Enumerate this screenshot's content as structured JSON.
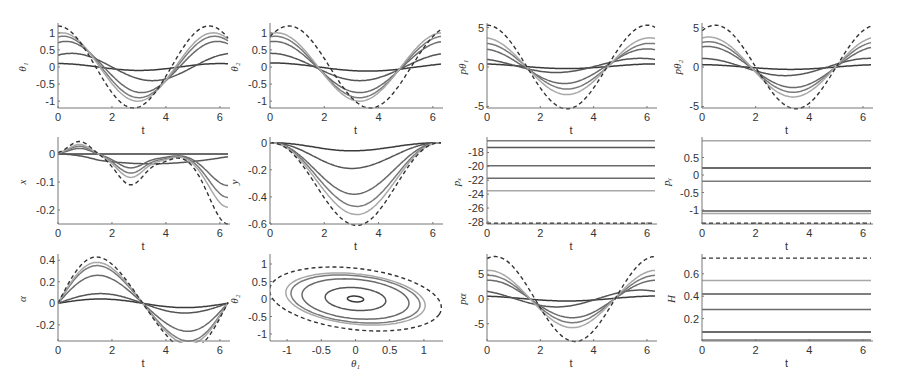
{
  "figure": {
    "rows": 3,
    "cols": 4,
    "curve_colors": [
      "#3a3a3a",
      "#555555",
      "#6a6a6a",
      "#7a7a7a",
      "#a8a8a8"
    ],
    "dashed_color": "#333333"
  },
  "chart_data": [
    {
      "id": "theta1",
      "type": "line",
      "ylabel": "θ₁",
      "xlabel": "t",
      "xlim": [
        0,
        6.3
      ],
      "ylim": [
        -1.2,
        1.2
      ],
      "xticks": [
        0,
        2,
        4,
        6
      ],
      "yticks": [
        -1,
        -0.5,
        0,
        0.5,
        1
      ],
      "ytick_labels": [
        "-1",
        "-0.5",
        "0",
        "0.5",
        "1"
      ],
      "box": [
        58,
        26,
        228,
        108
      ],
      "series": [
        {
          "kind": "cos",
          "amp": 0.1,
          "phase": 0,
          "period": 6.0,
          "style": "solid",
          "shade": 0
        },
        {
          "kind": "cos",
          "amp": 0.4,
          "phase": -0.5,
          "period": 6.0,
          "style": "solid",
          "shade": 1
        },
        {
          "kind": "cos",
          "amp": 0.75,
          "phase": -0.3,
          "period": 5.6,
          "style": "solid",
          "shade": 2
        },
        {
          "kind": "cos",
          "amp": 0.9,
          "phase": -0.2,
          "period": 5.6,
          "style": "solid",
          "shade": 3
        },
        {
          "kind": "cos",
          "amp": 1.0,
          "phase": -0.15,
          "period": 5.6,
          "style": "solid",
          "shade": 4
        },
        {
          "kind": "cos",
          "amp": 1.2,
          "phase": 0,
          "period": 5.6,
          "style": "dashed"
        }
      ]
    },
    {
      "id": "theta2",
      "type": "line",
      "ylabel": "θ₂",
      "xlabel": "t",
      "xlim": [
        0,
        6.3
      ],
      "ylim": [
        -1.2,
        1.2
      ],
      "xticks": [
        0,
        2,
        4,
        6
      ],
      "yticks": [
        -1,
        -0.5,
        0,
        0.5,
        1
      ],
      "ytick_labels": [
        "-1",
        "-0.5",
        "0",
        "0.5",
        "1"
      ],
      "box": [
        270,
        26,
        441,
        108
      ],
      "series": [
        {
          "kind": "cos",
          "amp": -0.12,
          "phase": -3.6,
          "period": 7.2,
          "style": "solid",
          "shade": 0
        },
        {
          "kind": "cos",
          "amp": -0.4,
          "phase": -3.3,
          "period": 6.6,
          "style": "solid",
          "shade": 1
        },
        {
          "kind": "cos",
          "amp": -0.75,
          "phase": -3.3,
          "period": 6.3,
          "style": "solid",
          "shade": 2
        },
        {
          "kind": "cos",
          "amp": -0.9,
          "phase": -3.3,
          "period": 6.2,
          "style": "solid",
          "shade": 3
        },
        {
          "kind": "cos",
          "amp": -1.0,
          "phase": -3.3,
          "period": 6.1,
          "style": "solid",
          "shade": 4
        },
        {
          "kind": "cos",
          "amp": -1.2,
          "phase": -3.7,
          "period": 6.0,
          "style": "dashed"
        }
      ]
    },
    {
      "id": "p_theta1",
      "type": "line",
      "ylabel": "pθ₁",
      "xlabel": "t",
      "xlim": [
        0,
        6.3
      ],
      "ylim": [
        -5.2,
        5.2
      ],
      "xticks": [
        0,
        2,
        4,
        6
      ],
      "yticks": [
        -5,
        0,
        5
      ],
      "ytick_labels": [
        "-5",
        "0",
        "5"
      ],
      "box": [
        487,
        26,
        655,
        108
      ],
      "series": [
        {
          "kind": "cos",
          "amp": -0.3,
          "phase": -3.0,
          "period": 6.8,
          "offset": 0.1,
          "style": "solid",
          "shade": 0
        },
        {
          "kind": "cos",
          "amp": -0.9,
          "phase": -2.6,
          "period": 6.3,
          "offset": 0.2,
          "style": "solid",
          "shade": 1
        },
        {
          "kind": "cos",
          "amp": -2.2,
          "phase": -2.9,
          "period": 6.2,
          "offset": 0.1,
          "style": "solid",
          "shade": 2
        },
        {
          "kind": "cos",
          "amp": -2.9,
          "phase": -3.0,
          "period": 6.2,
          "offset": 0.1,
          "style": "solid",
          "shade": 3
        },
        {
          "kind": "cos",
          "amp": -3.6,
          "phase": -3.0,
          "period": 6.2,
          "offset": 0.1,
          "style": "solid",
          "shade": 4
        },
        {
          "kind": "cos",
          "amp": -5.3,
          "phase": -3.0,
          "period": 6.0,
          "style": "dashed"
        }
      ]
    },
    {
      "id": "p_theta2",
      "type": "line",
      "ylabel": "pθ₂",
      "xlabel": "t",
      "xlim": [
        0,
        6.3
      ],
      "ylim": [
        -5.2,
        5.2
      ],
      "xticks": [
        0,
        2,
        4,
        6
      ],
      "yticks": [
        -5,
        0,
        5
      ],
      "ytick_labels": [
        "-5",
        "0",
        "5"
      ],
      "box": [
        702,
        26,
        871,
        108
      ],
      "series": [
        {
          "kind": "cos",
          "amp": -0.3,
          "phase": -3.3,
          "period": 6.8,
          "offset": 0.0,
          "style": "solid",
          "shade": 0
        },
        {
          "kind": "cos",
          "amp": -1.1,
          "phase": -3.1,
          "period": 6.3,
          "offset": 0.0,
          "style": "solid",
          "shade": 1
        },
        {
          "kind": "cos",
          "amp": -2.6,
          "phase": -3.4,
          "period": 6.4,
          "offset": 0.0,
          "style": "solid",
          "shade": 2
        },
        {
          "kind": "cos",
          "amp": -3.2,
          "phase": -3.4,
          "period": 6.3,
          "offset": 0.0,
          "style": "solid",
          "shade": 3
        },
        {
          "kind": "cos",
          "amp": -3.8,
          "phase": -3.4,
          "period": 6.3,
          "offset": 0.0,
          "style": "solid",
          "shade": 4
        },
        {
          "kind": "cos",
          "amp": -5.3,
          "phase": -3.5,
          "period": 6.0,
          "style": "dashed"
        }
      ]
    },
    {
      "id": "x",
      "type": "line",
      "ylabel": "x",
      "xlabel": "t",
      "xlim": [
        0,
        6.3
      ],
      "ylim": [
        -0.25,
        0.05
      ],
      "xticks": [
        0,
        2,
        4,
        6
      ],
      "yticks": [
        -0.2,
        -0.1,
        0
      ],
      "ytick_labels": [
        "-0.2",
        "-0.1",
        "0"
      ],
      "box": [
        58,
        140,
        228,
        224
      ],
      "series": [
        {
          "kind": "xmotion",
          "scale": 0.0,
          "style": "solid",
          "shade": 0
        },
        {
          "kind": "xmotion",
          "scale": 0.15,
          "style": "solid",
          "shade": 1
        },
        {
          "kind": "xmotion",
          "scale": 0.45,
          "style": "solid",
          "shade": 2
        },
        {
          "kind": "xmotion",
          "scale": 0.62,
          "style": "solid",
          "shade": 3
        },
        {
          "kind": "xmotion",
          "scale": 0.76,
          "style": "solid",
          "shade": 4
        },
        {
          "kind": "xmotion",
          "scale": 1.0,
          "style": "dashed"
        }
      ]
    },
    {
      "id": "y",
      "type": "line",
      "ylabel": "y",
      "xlabel": "t",
      "xlim": [
        0,
        6.3
      ],
      "ylim": [
        -0.6,
        0.02
      ],
      "xticks": [
        0,
        2,
        4,
        6
      ],
      "yticks": [
        -0.6,
        -0.4,
        -0.2,
        0
      ],
      "ytick_labels": [
        "-0.6",
        "-0.4",
        "-0.2",
        "0"
      ],
      "box": [
        270,
        140,
        441,
        224
      ],
      "series": [
        {
          "kind": "bowl",
          "depth": 0.06,
          "center": 3.0,
          "style": "solid",
          "shade": 0
        },
        {
          "kind": "bowl",
          "depth": 0.19,
          "center": 3.0,
          "style": "solid",
          "shade": 1
        },
        {
          "kind": "bowl",
          "depth": 0.38,
          "center": 3.1,
          "style": "solid",
          "shade": 2
        },
        {
          "kind": "bowl",
          "depth": 0.47,
          "center": 3.2,
          "style": "solid",
          "shade": 3
        },
        {
          "kind": "bowl",
          "depth": 0.53,
          "center": 3.2,
          "style": "solid",
          "shade": 4
        },
        {
          "kind": "bowl",
          "depth": 0.61,
          "center": 3.2,
          "style": "dashed"
        }
      ]
    },
    {
      "id": "p_x",
      "type": "line",
      "ylabel": "pₓ",
      "xlabel": "t",
      "xlim": [
        0,
        6.3
      ],
      "ylim": [
        -28.3,
        -16.2
      ],
      "xticks": [
        0,
        2,
        4,
        6
      ],
      "yticks": [
        -28,
        -26,
        -24,
        -22,
        -20,
        -18
      ],
      "ytick_labels": [
        "-28",
        "-26",
        "-24",
        "-22",
        "-20",
        "-18"
      ],
      "box": [
        487,
        140,
        655,
        224
      ],
      "series": [
        {
          "kind": "const",
          "value": -16.3,
          "style": "solid",
          "shade": 3
        },
        {
          "kind": "const",
          "value": -17.3,
          "style": "solid",
          "shade": 1
        },
        {
          "kind": "const",
          "value": -19.9,
          "style": "solid",
          "shade": 2
        },
        {
          "kind": "const",
          "value": -21.7,
          "style": "solid",
          "shade": 2
        },
        {
          "kind": "const",
          "value": -23.5,
          "style": "solid",
          "shade": 4
        },
        {
          "kind": "const",
          "value": -28.2,
          "style": "dashed"
        }
      ]
    },
    {
      "id": "p_y",
      "type": "line",
      "ylabel": "pᵧ",
      "xlabel": "t",
      "xlim": [
        0,
        6.3
      ],
      "ylim": [
        -1.4,
        1.0
      ],
      "xticks": [
        0,
        2,
        4,
        6
      ],
      "yticks": [
        -1,
        -0.5,
        0,
        0.5
      ],
      "ytick_labels": [
        "-1",
        "-0.5",
        "0",
        "0.5"
      ],
      "box": [
        702,
        140,
        871,
        224
      ],
      "series": [
        {
          "kind": "const",
          "value": 0.98,
          "style": "solid",
          "shade": 4
        },
        {
          "kind": "const",
          "value": 0.2,
          "style": "solid",
          "shade": 0
        },
        {
          "kind": "const",
          "value": -0.18,
          "style": "solid",
          "shade": 3
        },
        {
          "kind": "const",
          "value": -1.03,
          "style": "solid",
          "shade": 1
        },
        {
          "kind": "const",
          "value": -1.1,
          "style": "solid",
          "shade": 4
        },
        {
          "kind": "const",
          "value": -1.38,
          "style": "dashed"
        }
      ]
    },
    {
      "id": "alpha",
      "type": "line",
      "ylabel": "α",
      "xlabel": "t",
      "xlim": [
        0,
        6.3
      ],
      "ylim": [
        -0.35,
        0.43
      ],
      "xticks": [
        0,
        2,
        4,
        6
      ],
      "yticks": [
        -0.2,
        0,
        0.2,
        0.4
      ],
      "ytick_labels": [
        "-0.2",
        "0",
        "0.2",
        "0.4"
      ],
      "box": [
        58,
        257,
        228,
        341
      ],
      "series": [
        {
          "kind": "alpha",
          "amp": 0.04,
          "skew": 0.0,
          "style": "solid",
          "shade": 0
        },
        {
          "kind": "alpha",
          "amp": 0.09,
          "skew": 0.0,
          "style": "solid",
          "shade": 1
        },
        {
          "kind": "alpha",
          "amp": 0.26,
          "skew": 0.2,
          "style": "solid",
          "shade": 2
        },
        {
          "kind": "alpha",
          "amp": 0.35,
          "skew": 0.25,
          "style": "solid",
          "shade": 3
        },
        {
          "kind": "alpha",
          "amp": 0.38,
          "skew": 0.25,
          "style": "solid",
          "shade": 4
        },
        {
          "kind": "alpha",
          "amp": 0.43,
          "skew": 0.3,
          "style": "dashed"
        }
      ]
    },
    {
      "id": "phase",
      "type": "line",
      "ylabel": "θ₂",
      "xlabel": "θ₁",
      "xlim": [
        -1.25,
        1.25
      ],
      "ylim": [
        -1.2,
        1.2
      ],
      "xticks": [
        -1,
        -0.5,
        0,
        0.5,
        1
      ],
      "xtick_labels": [
        "-1",
        "-0.5",
        "0",
        "0.5",
        "1"
      ],
      "yticks": [
        -1,
        -0.5,
        0,
        0.5,
        1
      ],
      "ytick_labels": [
        "-1",
        "-0.5",
        "0",
        "0.5",
        "1"
      ],
      "box": [
        270,
        257,
        441,
        341
      ],
      "series": [
        {
          "kind": "ellipse",
          "rx": 0.12,
          "ry": 0.08,
          "tilt": -0.25,
          "style": "solid",
          "shade": 0
        },
        {
          "kind": "ellipse",
          "rx": 0.45,
          "ry": 0.32,
          "tilt": -0.25,
          "style": "solid",
          "shade": 1
        },
        {
          "kind": "ellipse",
          "rx": 0.8,
          "ry": 0.55,
          "tilt": -0.3,
          "style": "solid",
          "shade": 2
        },
        {
          "kind": "ellipse",
          "rx": 0.97,
          "ry": 0.65,
          "tilt": -0.32,
          "style": "solid",
          "shade": 3
        },
        {
          "kind": "ellipse",
          "rx": 1.05,
          "ry": 0.7,
          "tilt": -0.33,
          "style": "solid",
          "shade": 4
        },
        {
          "kind": "ellipse",
          "rx": 1.3,
          "ry": 0.85,
          "tilt": -0.35,
          "style": "dashed"
        }
      ]
    },
    {
      "id": "p_alpha",
      "type": "line",
      "ylabel": "pα",
      "xlabel": "t",
      "xlim": [
        0,
        6.3
      ],
      "ylim": [
        -8.5,
        8.5
      ],
      "xticks": [
        0,
        2,
        4,
        6
      ],
      "yticks": [
        -5,
        0,
        5
      ],
      "ytick_labels": [
        "-5",
        "0",
        "5"
      ],
      "box": [
        487,
        257,
        655,
        341
      ],
      "series": [
        {
          "kind": "cos",
          "amp": -0.5,
          "phase": -3.0,
          "period": 6.8,
          "offset": 0.1,
          "style": "solid",
          "shade": 0
        },
        {
          "kind": "cos",
          "amp": -1.7,
          "phase": -2.6,
          "period": 6.3,
          "offset": 0.1,
          "style": "solid",
          "shade": 1
        },
        {
          "kind": "cos",
          "amp": -3.8,
          "phase": -3.2,
          "period": 6.3,
          "offset": 0.0,
          "style": "solid",
          "shade": 2
        },
        {
          "kind": "cos",
          "amp": -4.8,
          "phase": -3.2,
          "period": 6.3,
          "offset": 0.0,
          "style": "solid",
          "shade": 3
        },
        {
          "kind": "cos",
          "amp": -5.8,
          "phase": -3.2,
          "period": 6.3,
          "offset": 0.0,
          "style": "solid",
          "shade": 4
        },
        {
          "kind": "cos",
          "amp": -8.6,
          "phase": -3.3,
          "period": 6.0,
          "style": "dashed"
        }
      ]
    },
    {
      "id": "H",
      "type": "line",
      "ylabel": "H",
      "xlabel": "t",
      "xlim": [
        0,
        6.3
      ],
      "ylim": [
        0,
        0.75
      ],
      "xticks": [
        0,
        2,
        4,
        6
      ],
      "yticks": [
        0.2,
        0.4,
        0.6
      ],
      "ytick_labels": [
        "0.2",
        "0.4",
        "0.6"
      ],
      "box": [
        702,
        257,
        871,
        341
      ],
      "series": [
        {
          "kind": "const",
          "value": 0.74,
          "style": "dashed"
        },
        {
          "kind": "const",
          "value": 0.54,
          "style": "solid",
          "shade": 4
        },
        {
          "kind": "const",
          "value": 0.42,
          "style": "solid",
          "shade": 1
        },
        {
          "kind": "const",
          "value": 0.28,
          "style": "solid",
          "shade": 2
        },
        {
          "kind": "const",
          "value": 0.08,
          "style": "solid",
          "shade": 0
        },
        {
          "kind": "const",
          "value": 0.01,
          "style": "solid",
          "shade": 3
        }
      ]
    }
  ]
}
